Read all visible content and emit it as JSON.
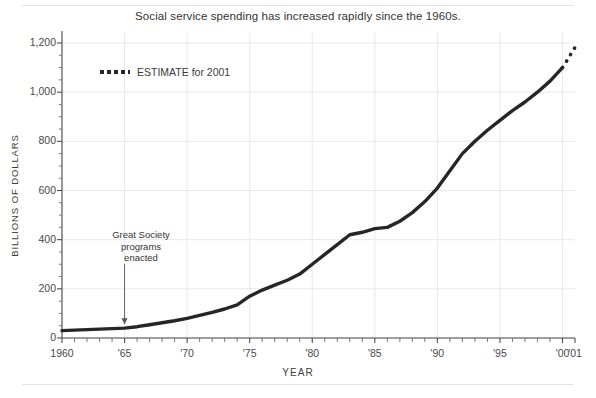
{
  "chart_data": {
    "type": "line",
    "title": "Social service spending has increased rapidly since the 1960s.",
    "xlabel": "YEAR",
    "ylabel": "BILLIONS OF DOLLARS",
    "xlim": [
      1960,
      2001
    ],
    "ylim": [
      0,
      1200
    ],
    "grid": true,
    "legend_position": "upper-left-inside",
    "y_ticks": [
      0,
      200,
      400,
      600,
      800,
      1000,
      1200
    ],
    "y_tick_labels": [
      "0",
      "200",
      "400",
      "600",
      "800",
      "1,000",
      "1,200"
    ],
    "y_minor_tick_step": 50,
    "x_ticks": [
      1960,
      1965,
      1970,
      1975,
      1980,
      1985,
      1990,
      1995,
      2000,
      2001
    ],
    "x_tick_labels": [
      "1960",
      "'65",
      "'70",
      "'75",
      "'80",
      "'85",
      "'90",
      "'95",
      "'00",
      "'01"
    ],
    "x_minor_tick_step": 1,
    "series": [
      {
        "name": "Social service spending",
        "style": "solid",
        "color": "#262626",
        "x": [
          1960,
          1961,
          1962,
          1963,
          1964,
          1965,
          1966,
          1967,
          1968,
          1969,
          1970,
          1971,
          1972,
          1973,
          1974,
          1975,
          1976,
          1977,
          1978,
          1979,
          1980,
          1981,
          1982,
          1983,
          1984,
          1985,
          1986,
          1987,
          1988,
          1989,
          1990,
          1991,
          1992,
          1993,
          1994,
          1995,
          1996,
          1997,
          1998,
          1999,
          2000
        ],
        "values": [
          30,
          32,
          34,
          36,
          38,
          40,
          46,
          54,
          62,
          70,
          80,
          92,
          104,
          118,
          135,
          170,
          195,
          215,
          235,
          260,
          300,
          340,
          380,
          420,
          430,
          445,
          450,
          475,
          510,
          555,
          610,
          680,
          750,
          800,
          845,
          885,
          925,
          960,
          1000,
          1045,
          1100
        ]
      },
      {
        "name": "ESTIMATE for 2001",
        "style": "dotted",
        "color": "#262626",
        "x": [
          2000,
          2000.25,
          2000.5,
          2000.75,
          2001
        ],
        "values": [
          1100,
          1120,
          1140,
          1162,
          1182
        ]
      }
    ],
    "legend": [
      {
        "label": "ESTIMATE for 2001",
        "style": "dotted"
      }
    ],
    "annotations": [
      {
        "text_lines": [
          "Great Society",
          "programs",
          "enacted"
        ],
        "x": 1965,
        "y": 40,
        "arrow": "down"
      }
    ]
  }
}
